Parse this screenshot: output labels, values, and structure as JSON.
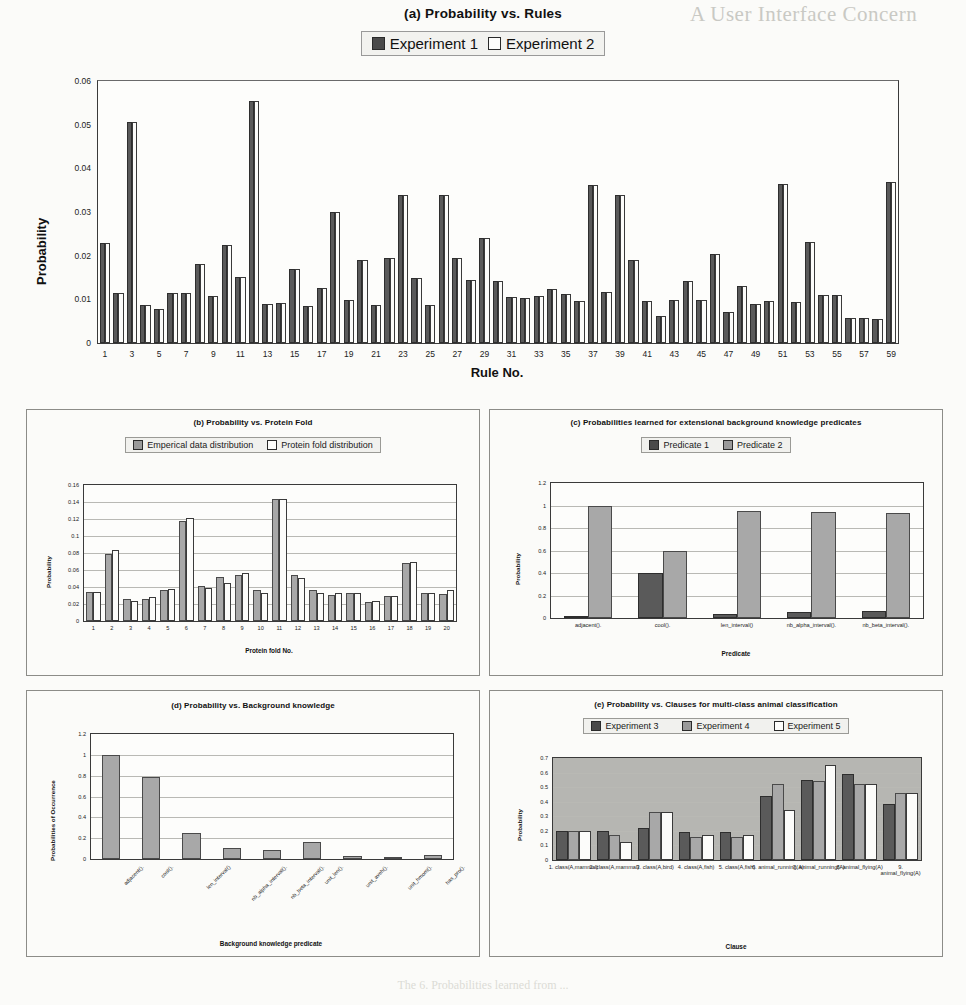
{
  "colors": {
    "series_dark": "#5a5a5a",
    "series_mid": "#a8a8a8",
    "series_light": "#fcfcfa",
    "axis": "#3a3a3a",
    "grid": "#b9b9b4",
    "plot_bg_grey": "#b6b6b2"
  },
  "ghost_text": {
    "top_right": "A  User Interface Concern",
    "caption": "The 6.  Probabilities learned from ..."
  },
  "chart_data": [
    {
      "id": "a",
      "type": "bar",
      "title": "(a) Probability vs. Rules",
      "xlabel": "Rule No.",
      "ylabel": "Probability",
      "ylim": [
        0,
        0.06
      ],
      "yticks": [
        "0",
        "0.01",
        "0.02",
        "0.03",
        "0.04",
        "0.05",
        "0.06"
      ],
      "ytick_values": [
        0,
        0.01,
        0.02,
        0.03,
        0.04,
        0.05,
        0.06
      ],
      "grid": false,
      "legend_position": "top-center",
      "legend": [
        "Experiment 1",
        "Experiment 2"
      ],
      "categories": [
        "1",
        "2",
        "3",
        "4",
        "5",
        "6",
        "7",
        "8",
        "9",
        "10",
        "11",
        "12",
        "13",
        "14",
        "15",
        "16",
        "17",
        "18",
        "19",
        "20",
        "21",
        "22",
        "23",
        "24",
        "25",
        "26",
        "27",
        "28",
        "29",
        "30",
        "31",
        "32",
        "33",
        "34",
        "35",
        "36",
        "37",
        "38",
        "39",
        "40",
        "41",
        "42",
        "43",
        "44",
        "45",
        "46",
        "47",
        "48",
        "49",
        "50",
        "51",
        "52",
        "53",
        "54",
        "55",
        "56",
        "57",
        "58",
        "59"
      ],
      "xtick_labels": [
        "1",
        "3",
        "5",
        "7",
        "9",
        "11",
        "13",
        "15",
        "17",
        "19",
        "21",
        "23",
        "25",
        "27",
        "29",
        "31",
        "33",
        "35",
        "37",
        "39",
        "41",
        "43",
        "45",
        "47",
        "49",
        "51",
        "53",
        "55",
        "57",
        "59"
      ],
      "series": [
        {
          "name": "Experiment 1",
          "values": [
            0.023,
            0.0115,
            0.0505,
            0.0088,
            0.0077,
            0.0114,
            0.0114,
            0.018,
            0.0108,
            0.0224,
            0.0151,
            0.0555,
            0.0089,
            0.0091,
            0.017,
            0.0085,
            0.0127,
            0.0299,
            0.0098,
            0.019,
            0.0087,
            0.0194,
            0.034,
            0.015,
            0.0086,
            0.034,
            0.0194,
            0.0145,
            0.024,
            0.0142,
            0.0105,
            0.0104,
            0.0108,
            0.0124,
            0.0112,
            0.0097,
            0.0363,
            0.0117,
            0.034,
            0.0191,
            0.0096,
            0.0062,
            0.0099,
            0.0141,
            0.0098,
            0.0204,
            0.0072,
            0.013,
            0.009,
            0.0096,
            0.0365,
            0.0094,
            0.0232,
            0.011,
            0.011,
            0.0058,
            0.0058,
            0.0056,
            0.0368
          ]
        },
        {
          "name": "Experiment 2",
          "values": [
            0.023,
            0.0115,
            0.0505,
            0.0088,
            0.0077,
            0.0114,
            0.0114,
            0.018,
            0.0108,
            0.0224,
            0.0151,
            0.0555,
            0.0089,
            0.0091,
            0.017,
            0.0085,
            0.0127,
            0.0299,
            0.0098,
            0.019,
            0.0087,
            0.0194,
            0.034,
            0.015,
            0.0086,
            0.034,
            0.0194,
            0.0145,
            0.024,
            0.0142,
            0.0105,
            0.0104,
            0.0108,
            0.0124,
            0.0112,
            0.0097,
            0.0363,
            0.0117,
            0.034,
            0.0191,
            0.0096,
            0.0062,
            0.0099,
            0.0141,
            0.0098,
            0.0204,
            0.0072,
            0.013,
            0.009,
            0.0096,
            0.0365,
            0.0094,
            0.0232,
            0.011,
            0.011,
            0.0058,
            0.0058,
            0.0056,
            0.0368
          ]
        }
      ]
    },
    {
      "id": "b",
      "type": "bar",
      "title": "(b) Probability vs. Protein Fold",
      "xlabel": "Protein fold No.",
      "ylabel": "Probability",
      "ylim": [
        0,
        0.16
      ],
      "yticks": [
        "0",
        "0.02",
        "0.04",
        "0.06",
        "0.08",
        "0.1",
        "0.12",
        "0.14",
        "0.16"
      ],
      "ytick_values": [
        0,
        0.02,
        0.04,
        0.06,
        0.08,
        0.1,
        0.12,
        0.14,
        0.16
      ],
      "grid": true,
      "legend_position": "top-center",
      "legend": [
        "Emperical data distribution",
        "Protein fold distribution"
      ],
      "categories": [
        "1",
        "2",
        "3",
        "4",
        "5",
        "6",
        "7",
        "8",
        "9",
        "10",
        "11",
        "12",
        "13",
        "14",
        "15",
        "16",
        "17",
        "18",
        "19",
        "20"
      ],
      "series": [
        {
          "name": "Emperical data distribution",
          "values": [
            0.034,
            0.079,
            0.026,
            0.026,
            0.037,
            0.118,
            0.041,
            0.052,
            0.054,
            0.036,
            0.144,
            0.054,
            0.036,
            0.031,
            0.033,
            0.022,
            0.03,
            0.068,
            0.033,
            0.032
          ]
        },
        {
          "name": "Protein fold distribution",
          "values": [
            0.034,
            0.083,
            0.023,
            0.028,
            0.038,
            0.121,
            0.039,
            0.045,
            0.057,
            0.033,
            0.143,
            0.051,
            0.033,
            0.033,
            0.033,
            0.024,
            0.03,
            0.069,
            0.033,
            0.037
          ]
        }
      ]
    },
    {
      "id": "c",
      "type": "bar",
      "title": "(c) Probabilities learned for extensional background knowledge predicates",
      "xlabel": "Predicate",
      "ylabel": "Probability",
      "ylim": [
        0,
        1.2
      ],
      "yticks": [
        "0",
        "0.2",
        "0.4",
        "0.6",
        "0.8",
        "1",
        "1.2"
      ],
      "ytick_values": [
        0,
        0.2,
        0.4,
        0.6,
        0.8,
        1.0,
        1.2
      ],
      "grid": true,
      "legend_position": "top-center",
      "legend": [
        "Predicate 1",
        "Predicate 2"
      ],
      "categories": [
        "adjacent().",
        "cool().",
        "len_interval()",
        "nb_alpha_interval().",
        "nb_beta_interval()."
      ],
      "series": [
        {
          "name": "Predicate 1",
          "values": [
            0.0,
            0.4,
            0.04,
            0.05,
            0.06
          ]
        },
        {
          "name": "Predicate 2",
          "values": [
            1.0,
            0.6,
            0.95,
            0.94,
            0.93
          ]
        }
      ]
    },
    {
      "id": "d",
      "type": "bar",
      "title": "(d) Probability vs. Background knowledge",
      "xlabel": "Background knowledge predicate",
      "ylabel": "Probabilities of Occurrence",
      "ylim": [
        0,
        1.2
      ],
      "yticks": [
        "0",
        "0.2",
        "0.4",
        "0.6",
        "0.8",
        "1",
        "1.2"
      ],
      "ytick_values": [
        0,
        0.2,
        0.4,
        0.6,
        0.8,
        1.0,
        1.2
      ],
      "grid": true,
      "legend_position": "none",
      "legend": [],
      "categories": [
        "adjacent().",
        "cool().",
        "len_interval()",
        "nb_alpha_interval().",
        "nb_beta_interval().",
        "unit_len().",
        "unit_aveh().",
        "unit_hmom().",
        "has_pro()."
      ],
      "series": [
        {
          "name": "Probability of occurrence",
          "values": [
            1.0,
            0.79,
            0.25,
            0.11,
            0.09,
            0.16,
            0.025,
            0.015,
            0.04
          ]
        }
      ]
    },
    {
      "id": "e",
      "type": "bar",
      "title": "(e) Probability vs. Clauses for multi-class animal classification",
      "xlabel": "Clause",
      "ylabel": "Probability",
      "ylim": [
        0,
        0.7
      ],
      "yticks": [
        "0",
        "0.1",
        "0.2",
        "0.3",
        "0.4",
        "0.5",
        "0.6",
        "0.7"
      ],
      "ytick_values": [
        0,
        0.1,
        0.2,
        0.3,
        0.4,
        0.5,
        0.6,
        0.7
      ],
      "grid": true,
      "legend_position": "top-center",
      "legend": [
        "Experiment 3",
        "Experiment 4",
        "Experiment 5"
      ],
      "categories": [
        "1. class(A,mammal)",
        "2. class(A,mammal)",
        "3. class(A,bird)",
        "4. class(A,fish)",
        "5. class(A,fish)",
        "6. animal_running(A)",
        "7. animal_running(A)",
        "8. animal_flying(A)",
        "9. animal_flying(A)"
      ],
      "series": [
        {
          "name": "Experiment 3",
          "values": [
            0.2,
            0.2,
            0.22,
            0.19,
            0.19,
            0.44,
            0.55,
            0.59,
            0.385
          ]
        },
        {
          "name": "Experiment 4",
          "values": [
            0.2,
            0.175,
            0.33,
            0.155,
            0.155,
            0.52,
            0.54,
            0.525,
            0.46
          ]
        },
        {
          "name": "Experiment 5",
          "values": [
            0.2,
            0.125,
            0.33,
            0.175,
            0.175,
            0.34,
            0.65,
            0.525,
            0.46
          ]
        }
      ]
    }
  ]
}
